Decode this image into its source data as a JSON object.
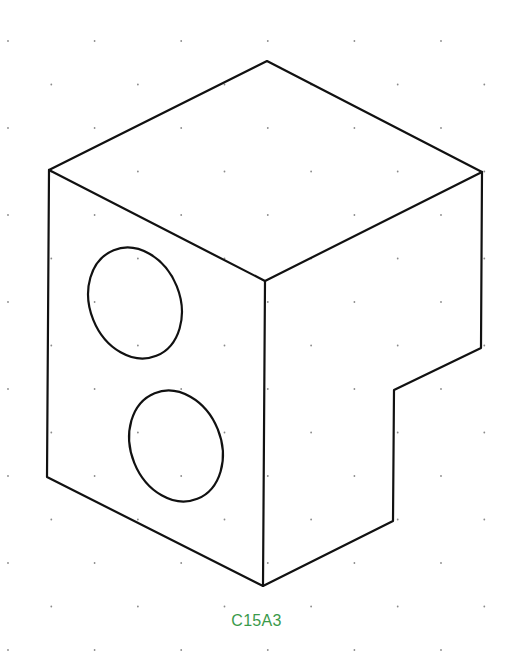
{
  "figure": {
    "caption": "C15A3",
    "caption_color": "#3a9a4a",
    "line_color": "#111111",
    "dot_color": "#8a8a8a",
    "background": "#ffffff"
  },
  "grid": {
    "type": "isometric-dots",
    "col_spacing": 43.3,
    "row_spacing": 43.5,
    "x0": 8,
    "y0": 41
  },
  "object": {
    "outline_points": [
      [
        267,
        61
      ],
      [
        482,
        172
      ],
      [
        481,
        348
      ],
      [
        394,
        390
      ],
      [
        393,
        521
      ],
      [
        263,
        586
      ],
      [
        47,
        477
      ],
      [
        49,
        170
      ]
    ],
    "inner_edges": [
      [
        [
          49,
          170
        ],
        [
          265,
          281
        ]
      ],
      [
        [
          265,
          281
        ],
        [
          482,
          172
        ]
      ],
      [
        [
          265,
          281
        ],
        [
          263,
          586
        ]
      ]
    ],
    "holes": [
      {
        "cx": 135,
        "cy": 303,
        "rx": 45,
        "ry": 57,
        "rotate": -22
      },
      {
        "cx": 176,
        "cy": 446,
        "rx": 45,
        "ry": 57,
        "rotate": -22
      }
    ],
    "stroke_width": 2.2
  }
}
